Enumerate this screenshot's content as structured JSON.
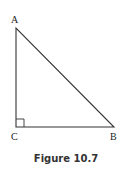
{
  "diagram": {
    "vertices": {
      "A": {
        "label": "A",
        "x": 16,
        "y": 28
      },
      "C": {
        "label": "C",
        "x": 16,
        "y": 127
      },
      "B": {
        "label": "B",
        "x": 114,
        "y": 127
      }
    },
    "right_angle_at": "C",
    "caption": "Figure 10.7"
  }
}
